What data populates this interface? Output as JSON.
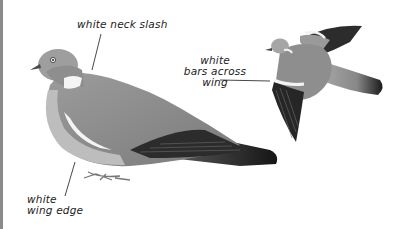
{
  "illustration": {
    "subject": "Wood pigeon identification plate",
    "labels": {
      "neck": "white neck slash",
      "bars": [
        "white",
        "bars across",
        "wing"
      ],
      "edge": [
        "white",
        "wing edge"
      ]
    },
    "colors": {
      "body": "#8d8d8d",
      "breast": "#a5a5a5",
      "head": "#9a9a9a",
      "primaries": "#2a2a2a",
      "white_marks": "#f2f2f2",
      "tail_tip": "#1c1c1c",
      "leader_line": "#333333",
      "frame_edge": "#8a8a8a"
    }
  }
}
